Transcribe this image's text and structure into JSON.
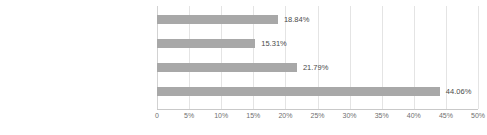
{
  "chart_data": {
    "type": "bar",
    "orientation": "horizontal",
    "title": "",
    "xlabel": "",
    "ylabel": "",
    "xlim": [
      0,
      50
    ],
    "grid": true,
    "legend": false,
    "categories": [
      "已经清晰地规划出近三年或更长的数字化建设目标",
      "正在规划中，具体内容还没出来",
      "没有规划，就是几个业务板块在用着看",
      "我不清楚，无从判断"
    ],
    "values": [
      44.06,
      21.79,
      15.31,
      18.84
    ],
    "value_labels": [
      "44.06%",
      "21.79%",
      "15.31%",
      "18.84%"
    ],
    "bar_color": "#a8a8a8",
    "grid_color": "#e4e4e4",
    "xticks": [
      0,
      5,
      10,
      15,
      20,
      25,
      30,
      35,
      40,
      45,
      50
    ],
    "xtick_labels": [
      "0",
      "5%",
      "10%",
      "15%",
      "20%",
      "25%",
      "30%",
      "35%",
      "40%",
      "45%",
      "50%"
    ]
  },
  "bars": [
    {
      "label": "我不清楚，无从判断",
      "value": 18.84,
      "value_label": "18.84%"
    },
    {
      "label": "没有规划，就是几个业务板块在用着看",
      "value": 15.31,
      "value_label": "15.31%"
    },
    {
      "label": "正在规划中，具体内容还没出来",
      "value": 21.79,
      "value_label": "21.79%"
    },
    {
      "label": "已经清晰地规划出近三年或更长的数字化建设目标",
      "value": 44.06,
      "value_label": "44.06%"
    }
  ],
  "xticks": [
    {
      "value": 0,
      "label": "0"
    },
    {
      "value": 5,
      "label": "5%"
    },
    {
      "value": 10,
      "label": "10%"
    },
    {
      "value": 15,
      "label": "15%"
    },
    {
      "value": 20,
      "label": "20%"
    },
    {
      "value": 25,
      "label": "25%"
    },
    {
      "value": 30,
      "label": "30%"
    },
    {
      "value": 35,
      "label": "35%"
    },
    {
      "value": 40,
      "label": "40%"
    },
    {
      "value": 45,
      "label": "45%"
    },
    {
      "value": 50,
      "label": "50%"
    }
  ]
}
